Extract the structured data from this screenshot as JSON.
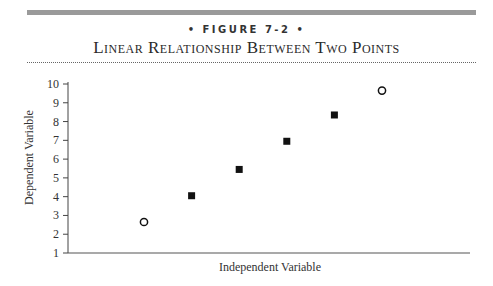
{
  "figure": {
    "label": "• FIGURE 7-2 •",
    "title": "Linear Relationship Between Two Points"
  },
  "chart_data": {
    "type": "scatter",
    "title": "Linear Relationship Between Two Points",
    "xlabel": "Independent Variable",
    "ylabel": "Dependent Variable",
    "ylim": [
      1,
      10
    ],
    "yticks": [
      1,
      2,
      3,
      4,
      5,
      6,
      7,
      8,
      9,
      10
    ],
    "xticks": [],
    "grid": false,
    "series": [
      {
        "name": "endpoints (open circles)",
        "marker": "open-circle",
        "points": [
          {
            "x": 1,
            "y": 2.65
          },
          {
            "x": 6,
            "y": 9.65
          }
        ]
      },
      {
        "name": "intermediate points (filled squares)",
        "marker": "filled-square",
        "points": [
          {
            "x": 2,
            "y": 4.05
          },
          {
            "x": 3,
            "y": 5.45
          },
          {
            "x": 4,
            "y": 6.95
          },
          {
            "x": 5,
            "y": 8.35
          }
        ]
      }
    ]
  }
}
